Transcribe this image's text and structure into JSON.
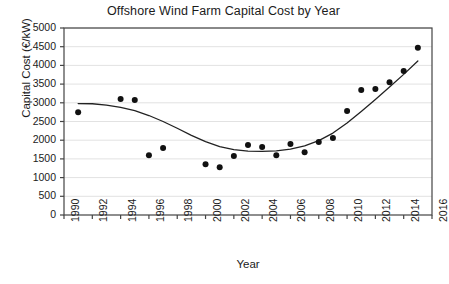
{
  "chart_data": {
    "type": "scatter",
    "title": "Offshore Wind Farm Capital Cost by Year",
    "xlabel": "Year",
    "ylabel": "Capital Cost (€/kW)",
    "xlim": [
      1990,
      2016
    ],
    "ylim": [
      0,
      5000
    ],
    "xticks": [
      1990,
      1992,
      1994,
      1996,
      1998,
      2000,
      2002,
      2004,
      2006,
      2008,
      2010,
      2012,
      2014,
      2016
    ],
    "yticks": [
      0,
      500,
      1000,
      1500,
      2000,
      2500,
      3000,
      3500,
      4000,
      4500,
      5000
    ],
    "grid": "horizontal",
    "legend": "none",
    "marker_color": "#111111",
    "trendline_color": "#222222",
    "series": [
      {
        "name": "Capital cost data points",
        "x": [
          1991,
          1994,
          1995,
          1996,
          1997,
          2000,
          2001,
          2002,
          2003,
          2004,
          2005,
          2006,
          2007,
          2008,
          2009,
          2010,
          2011,
          2012,
          2013,
          2014,
          2015
        ],
        "values": [
          2750,
          3100,
          3075,
          1600,
          1790,
          1360,
          1280,
          1575,
          1870,
          1820,
          1600,
          1900,
          1680,
          1950,
          2060,
          2780,
          3340,
          3370,
          3550,
          3850,
          4470
        ]
      },
      {
        "name": "Fitted trend curve",
        "x": [
          1991,
          1992,
          1993,
          1994,
          1995,
          1996,
          1997,
          1998,
          1999,
          2000,
          2001,
          2002,
          2003,
          2004,
          2005,
          2006,
          2007,
          2008,
          2009,
          2010,
          2011,
          2012,
          2013,
          2014,
          2015
        ],
        "values": [
          2980,
          2975,
          2940,
          2880,
          2790,
          2660,
          2500,
          2320,
          2130,
          1960,
          1830,
          1750,
          1710,
          1700,
          1715,
          1760,
          1850,
          1990,
          2190,
          2460,
          2770,
          3090,
          3420,
          3760,
          4120
        ]
      }
    ]
  },
  "axis": {
    "x_tick_labels": [
      "1990",
      "1992",
      "1994",
      "1996",
      "1998",
      "2000",
      "2002",
      "2004",
      "2006",
      "2008",
      "2010",
      "2012",
      "2014",
      "2016"
    ],
    "y_tick_labels": [
      "5000",
      "4500",
      "4000",
      "3500",
      "3000",
      "2500",
      "2000",
      "1500",
      "1000",
      "500",
      "0"
    ]
  }
}
